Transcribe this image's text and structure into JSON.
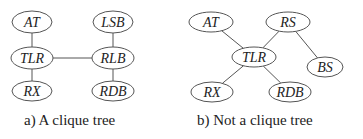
{
  "panels": [
    {
      "caption": "a) A clique tree",
      "nodes": [
        {
          "id": "AT",
          "label": "AT",
          "cx": 32,
          "cy": 22,
          "rx": 20,
          "ry": 11
        },
        {
          "id": "LSB",
          "label": "LSB",
          "cx": 113,
          "cy": 22,
          "rx": 20,
          "ry": 11
        },
        {
          "id": "TLR",
          "label": "TLR",
          "cx": 32,
          "cy": 58,
          "rx": 21,
          "ry": 11
        },
        {
          "id": "RLB",
          "label": "RLB",
          "cx": 113,
          "cy": 58,
          "rx": 21,
          "ry": 11
        },
        {
          "id": "RX",
          "label": "RX",
          "cx": 32,
          "cy": 91,
          "rx": 20,
          "ry": 10
        },
        {
          "id": "RDB",
          "label": "RDB",
          "cx": 113,
          "cy": 91,
          "rx": 21,
          "ry": 10
        }
      ],
      "edges": [
        [
          "AT",
          "TLR"
        ],
        [
          "TLR",
          "RX"
        ],
        [
          "TLR",
          "RLB"
        ],
        [
          "LSB",
          "RLB"
        ],
        [
          "RLB",
          "RDB"
        ]
      ]
    },
    {
      "caption": "b) Not a clique tree",
      "nodes": [
        {
          "id": "AT",
          "label": "AT",
          "cx": 211,
          "cy": 22,
          "rx": 22,
          "ry": 10
        },
        {
          "id": "RS",
          "label": "RS",
          "cx": 288,
          "cy": 22,
          "rx": 22,
          "ry": 10
        },
        {
          "id": "TLR",
          "label": "TLR",
          "cx": 254,
          "cy": 57,
          "rx": 22,
          "ry": 10
        },
        {
          "id": "BS",
          "label": "BS",
          "cx": 325,
          "cy": 67,
          "rx": 18,
          "ry": 10
        },
        {
          "id": "RX",
          "label": "RX",
          "cx": 212,
          "cy": 92,
          "rx": 21,
          "ry": 10
        },
        {
          "id": "RDB",
          "label": "RDB",
          "cx": 290,
          "cy": 92,
          "rx": 21,
          "ry": 10
        }
      ],
      "edges": [
        [
          "AT",
          "TLR"
        ],
        [
          "RS",
          "TLR"
        ],
        [
          "RS",
          "BS"
        ],
        [
          "TLR",
          "RX"
        ],
        [
          "TLR",
          "RDB"
        ]
      ]
    }
  ],
  "colors": {
    "stroke": "#555555",
    "text": "#222222"
  }
}
